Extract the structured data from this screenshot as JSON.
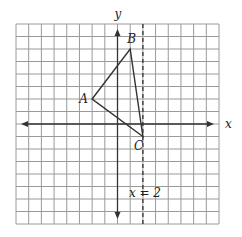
{
  "diagram": {
    "type": "coordinate-grid",
    "grid": {
      "xmin": -8,
      "xmax": 8,
      "ymin": -8,
      "ymax": 8,
      "step": 1
    },
    "axes": {
      "x_label": "x",
      "y_label": "y"
    },
    "line": {
      "equation_label": "x = 2",
      "x": 2,
      "style": "dashed"
    },
    "triangle": {
      "vertices": [
        {
          "name": "A",
          "x": -2,
          "y": 2
        },
        {
          "name": "B",
          "x": 1,
          "y": 6
        },
        {
          "name": "C",
          "x": 2,
          "y": -1
        }
      ]
    },
    "colors": {
      "grid": "#9a9a9a",
      "axis": "#333333",
      "shape": "#333333"
    }
  }
}
